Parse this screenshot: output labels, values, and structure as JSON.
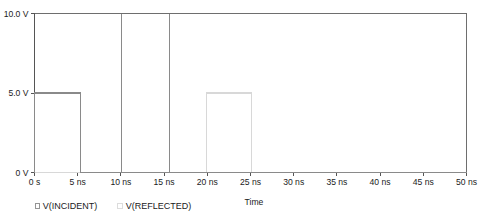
{
  "chart_data": {
    "type": "line",
    "title": "",
    "xlabel": "Time",
    "ylabel": "",
    "xlim": [
      0,
      50
    ],
    "ylim": [
      0,
      10
    ],
    "grid": false,
    "legend_position": "bottom",
    "x_unit": "ns",
    "y_unit": "V",
    "xticks": [
      0,
      5,
      10,
      15,
      20,
      25,
      30,
      35,
      40,
      45,
      50
    ],
    "xticklabels": [
      "0 s",
      "5 ns",
      "10 ns",
      "15 ns",
      "20 ns",
      "25 ns",
      "30 ns",
      "35 ns",
      "40 ns",
      "45 ns",
      "50 ns"
    ],
    "yticks": [
      0,
      5,
      10
    ],
    "yticklabels": [
      "0 V",
      "5.0 V",
      "10.0 V"
    ],
    "series": [
      {
        "name": "V(INCIDENT)",
        "color": "#8a8a8a",
        "points": [
          [
            0,
            0
          ],
          [
            0,
            5
          ],
          [
            5.3,
            5
          ],
          [
            5.3,
            0
          ],
          [
            10.1,
            0
          ],
          [
            10.1,
            10
          ],
          [
            10.1,
            0
          ],
          [
            15.6,
            0
          ],
          [
            15.6,
            10
          ],
          [
            15.6,
            0
          ],
          [
            50,
            0
          ]
        ]
      },
      {
        "name": "V(REFLECTED)",
        "color": "#d8d8d8",
        "points": [
          [
            0,
            0
          ],
          [
            19.9,
            0
          ],
          [
            19.9,
            5
          ],
          [
            25.1,
            5
          ],
          [
            25.1,
            0
          ],
          [
            50,
            0
          ]
        ]
      }
    ],
    "frame_lines": [
      {
        "name": "top-rail",
        "from": [
          0,
          10
        ],
        "to": [
          50,
          10
        ],
        "color": "#6e6e6e"
      },
      {
        "name": "right-rail",
        "from": [
          50,
          0
        ],
        "to": [
          50,
          10
        ],
        "color": "#6e6e6e"
      }
    ]
  },
  "legend": {
    "items": [
      {
        "label": "V(INCIDENT)",
        "marker_color": "#8a8a8a"
      },
      {
        "label": "V(REFLECTED)",
        "marker_color": "#d8d8d8"
      }
    ]
  },
  "axes": {
    "x_title": "Time"
  },
  "colors": {
    "axis": "#555555",
    "text": "#1b1b1b",
    "incident": "#8a8a8a",
    "reflected": "#d8d8d8",
    "background": "#ffffff"
  }
}
